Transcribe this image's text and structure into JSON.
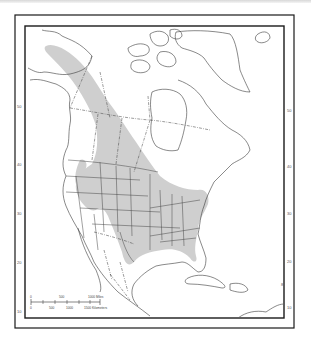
{
  "map": {
    "type": "species range map",
    "region": "North America",
    "range_fill_color": "#cfcfcf",
    "frame_color": "#1a1a1a",
    "latitude_labels_left": [
      "50",
      "40",
      "30",
      "20",
      "10"
    ],
    "latitude_labels_right": [
      "50",
      "40",
      "30",
      "20",
      "10"
    ],
    "extra_right_label": "8",
    "scale_bar": {
      "miles_labels": [
        "0",
        "500",
        "1000 Miles"
      ],
      "km_labels": [
        "0",
        "500",
        "1000",
        "1500 Kilometers"
      ]
    }
  }
}
